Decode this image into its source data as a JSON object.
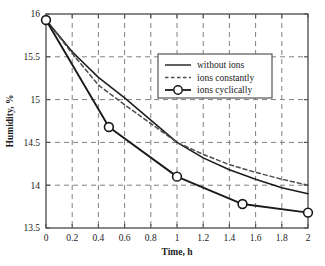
{
  "chart_data": {
    "type": "line",
    "title": "",
    "xlabel": "Time, h",
    "ylabel": "Humidity, %",
    "xlim": [
      0,
      2
    ],
    "ylim": [
      13.5,
      16
    ],
    "xticks": [
      "0",
      "0.2",
      "0.4",
      "0.6",
      "0.8",
      "1",
      "1.2",
      "1.4",
      "1.6",
      "1.8",
      "2"
    ],
    "xtick_values": [
      0,
      0.2,
      0.4,
      0.6,
      0.8,
      1.0,
      1.2,
      1.4,
      1.6,
      1.8,
      2.0
    ],
    "yticks": [
      "13.5",
      "14",
      "14.5",
      "15",
      "15.5",
      "16"
    ],
    "ytick_values": [
      13.5,
      14,
      14.5,
      15,
      15.5,
      16
    ],
    "grid": true,
    "grid_style": "dashed",
    "legend_position": "upper-right-inside",
    "series": [
      {
        "name": "without ions",
        "style": "solid",
        "marker": "none",
        "color": "#1a1a1a",
        "x": [
          0,
          0.2,
          0.4,
          0.6,
          0.8,
          1.0,
          1.2,
          1.4,
          1.6,
          1.8,
          2.0
        ],
        "values": [
          15.93,
          15.56,
          15.26,
          15.02,
          14.76,
          14.5,
          14.32,
          14.18,
          14.07,
          13.97,
          13.9
        ]
      },
      {
        "name": "ions constantly",
        "style": "dashed",
        "marker": "none",
        "color": "#4d4d4d",
        "x": [
          0,
          0.2,
          0.4,
          0.6,
          0.8,
          1.0,
          1.2,
          1.4,
          1.6,
          1.8,
          2.0
        ],
        "values": [
          15.93,
          15.54,
          15.17,
          14.94,
          14.72,
          14.5,
          14.36,
          14.24,
          14.15,
          14.07,
          14.0
        ]
      },
      {
        "name": "ions cyclically",
        "style": "solid",
        "marker": "circle",
        "color": "#1a1a1a",
        "x": [
          0,
          0.48,
          1.0,
          1.5,
          2.0
        ],
        "values": [
          15.93,
          14.68,
          14.1,
          13.78,
          13.68
        ]
      }
    ]
  },
  "legend": {
    "entries": [
      {
        "label": "without ions"
      },
      {
        "label": "ions constantly"
      },
      {
        "label": "ions cyclically"
      }
    ]
  },
  "axes": {
    "x_title": "Time, h",
    "y_title": "Humidity, %"
  }
}
